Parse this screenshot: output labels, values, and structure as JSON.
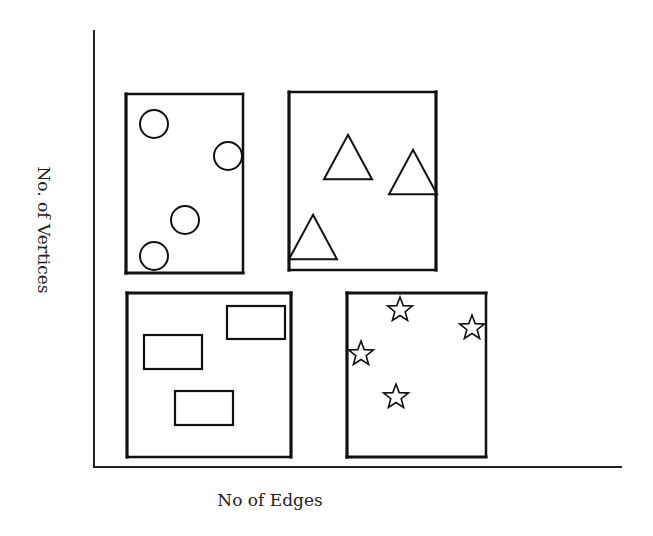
{
  "axes": {
    "x_label": "No of Edges",
    "y_label": "No. of Vertices"
  },
  "colors": {
    "stroke": "#111111",
    "background": "#ffffff"
  },
  "panels": [
    {
      "id": "top-left",
      "shape": "circle",
      "count": 4,
      "box": {
        "x": 126,
        "y": 94,
        "w": 117,
        "h": 179
      },
      "dotted_edges": [
        "top",
        "right"
      ],
      "items": [
        [
          154,
          124
        ],
        [
          228,
          156
        ],
        [
          185,
          220
        ],
        [
          154,
          256
        ]
      ],
      "size": 14
    },
    {
      "id": "top-right",
      "shape": "triangle",
      "count": 3,
      "box": {
        "x": 289,
        "y": 92,
        "w": 147,
        "h": 178
      },
      "dotted_edges": [
        "top",
        "bottom"
      ],
      "items": [
        [
          348,
          157
        ],
        [
          413,
          172
        ],
        [
          313,
          237
        ]
      ],
      "size": 24
    },
    {
      "id": "bottom-left",
      "shape": "rectangle",
      "count": 3,
      "box": {
        "x": 127,
        "y": 293,
        "w": 164,
        "h": 164
      },
      "dotted_edges": [
        "bottom"
      ],
      "items": [
        [
          144,
          335,
          58,
          34
        ],
        [
          227,
          306,
          58,
          33
        ],
        [
          175,
          391,
          58,
          34
        ]
      ],
      "size": 0
    },
    {
      "id": "bottom-right",
      "shape": "star",
      "count": 4,
      "box": {
        "x": 347,
        "y": 293,
        "w": 139,
        "h": 164
      },
      "dotted_edges": [
        "right"
      ],
      "items": [
        [
          400,
          310
        ],
        [
          472,
          328
        ],
        [
          361,
          354
        ],
        [
          396,
          397
        ]
      ],
      "size": 13
    }
  ]
}
